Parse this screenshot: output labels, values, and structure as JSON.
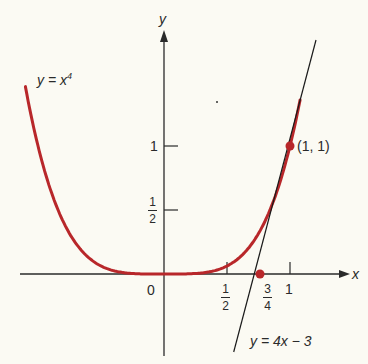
{
  "colors": {
    "curve": "#b8272a",
    "axis": "#2a2a2a",
    "tangent": "#1a1a1a",
    "point": "#b8272a",
    "background": "#fbfaf3"
  },
  "axes": {
    "x_label": "x",
    "y_label": "y",
    "origin_label": "0"
  },
  "ticks": {
    "x": [
      {
        "num": "1",
        "den": "2"
      },
      {
        "num": "3",
        "den": "4"
      },
      {
        "label": "1"
      }
    ],
    "y": [
      {
        "num": "1",
        "den": "2"
      },
      {
        "label": "1"
      }
    ]
  },
  "annotations": {
    "curve_label": "y = x",
    "curve_exponent": "4",
    "tangent_label": "y = 4x − 3",
    "point_label": "(1, 1)"
  },
  "chart_data": {
    "type": "line",
    "title": "",
    "xlabel": "x",
    "ylabel": "y",
    "series": [
      {
        "name": "y = x^4",
        "function": "x^4",
        "x_range": [
          -1.1,
          1.08
        ]
      },
      {
        "name": "y = 4x - 3",
        "function": "4x - 3",
        "x_range": [
          0.55,
          1.12
        ]
      }
    ],
    "points": [
      {
        "label": "(1, 1)",
        "x": 1,
        "y": 1
      },
      {
        "label": "3/4",
        "x": 0.75,
        "y": 0
      }
    ],
    "x_ticks": [
      "1/2",
      "3/4",
      "1"
    ],
    "y_ticks": [
      "1/2",
      "1"
    ],
    "xlim": [
      -0.85,
      1.4
    ],
    "ylim": [
      -0.6,
      1.9
    ],
    "grid": false,
    "legend": "none (inline labels)"
  }
}
